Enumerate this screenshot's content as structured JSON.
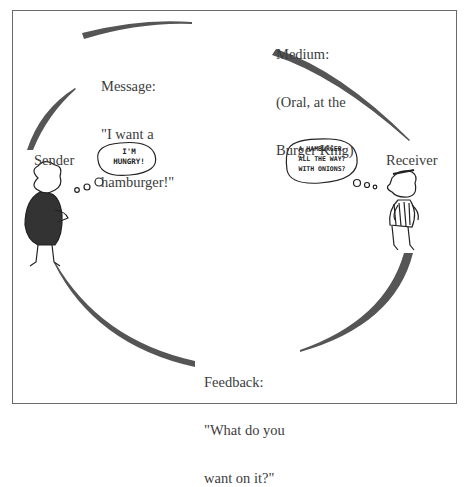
{
  "diagram": {
    "type": "communication-process-cycle",
    "nodes": {
      "message": {
        "title": "Message:",
        "line1": "\"I want a",
        "line2": "hamburger!\""
      },
      "medium": {
        "title": "Medium:",
        "line1": "(Oral, at the",
        "line2": "Burger King)"
      },
      "sender": {
        "label": "Sender"
      },
      "receiver": {
        "label": "Receiver"
      },
      "feedback": {
        "title": "Feedback:",
        "line1": "\"What do you",
        "line2": "want on it?\""
      }
    },
    "thought_bubbles": {
      "sender": {
        "line1": "I'M",
        "line2": "HUNGRY!"
      },
      "receiver": {
        "line1": "A HAMBURGER-",
        "line2": "ALL THE WAY?",
        "line3": "WITH ONIONS?"
      }
    },
    "colors": {
      "arc": "#555555",
      "border": "#6a6a6a",
      "text": "#3c3c3c"
    }
  }
}
